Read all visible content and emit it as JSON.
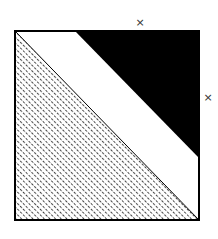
{
  "diagram": {
    "square": {
      "x": 15,
      "y": 31,
      "width": 184,
      "height": 189,
      "stroke": "#000000"
    },
    "regions": [
      {
        "name": "hatched-lower-left-triangle",
        "points": "15,31 199,220 15,220",
        "fill": "hatch",
        "hatch_color": "#444444"
      },
      {
        "name": "white-diagonal-band",
        "points": "15,31 75,31 199,158 199,220",
        "fill": "#ffffff"
      },
      {
        "name": "black-upper-right-triangle",
        "points": "75,31 199,31 199,158",
        "fill": "#000000"
      }
    ],
    "markers": [
      {
        "label": "×",
        "x": 140,
        "y": 22
      },
      {
        "label": "×",
        "x": 208,
        "y": 97
      }
    ]
  }
}
